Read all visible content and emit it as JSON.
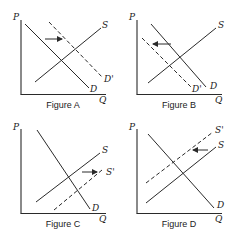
{
  "axis_labels": {
    "price": "P",
    "quantity": "Q"
  },
  "colors": {
    "ink": "#2a2a2a",
    "background": "#ffffff"
  },
  "figures": [
    {
      "caption": "Figure A",
      "curves": {
        "demand": "D",
        "supply": "S",
        "shifted": "D'"
      },
      "shift": "demand shifts right",
      "arrow_direction": "right"
    },
    {
      "caption": "Figure B",
      "curves": {
        "demand": "D",
        "supply": "S",
        "shifted": "D'"
      },
      "shift": "demand shifts left",
      "arrow_direction": "left"
    },
    {
      "caption": "Figure C",
      "curves": {
        "demand": "D",
        "supply": "S",
        "shifted": "S'"
      },
      "shift": "supply shifts right",
      "arrow_direction": "right"
    },
    {
      "caption": "Figure D",
      "curves": {
        "demand": "D",
        "supply": "S",
        "shifted": "S'"
      },
      "shift": "supply shifts left",
      "arrow_direction": "left"
    }
  ]
}
